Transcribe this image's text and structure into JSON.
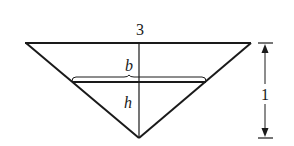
{
  "diagram": {
    "type": "inverted-triangle-trough",
    "labels": {
      "top_width": "3",
      "water_surface_width": "b",
      "water_depth": "h",
      "total_height": "1"
    },
    "colors": {
      "stroke": "#1a1a1a",
      "background": "#ffffff"
    }
  }
}
